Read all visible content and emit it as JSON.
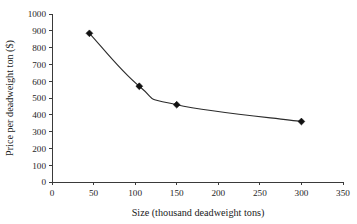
{
  "chart_data": {
    "type": "line",
    "title": "",
    "xlabel": "Size (thousand deadweight tons)",
    "ylabel": "Price per deadweight ton ($)",
    "xlim": [
      0,
      350
    ],
    "ylim": [
      0,
      1000
    ],
    "xticks": [
      0,
      50,
      100,
      150,
      200,
      250,
      300,
      350
    ],
    "yticks": [
      0,
      100,
      200,
      300,
      400,
      500,
      600,
      700,
      800,
      900,
      1000
    ],
    "xtick_labels": [
      "0",
      "50",
      "100",
      "150",
      "200",
      "250",
      "300",
      "350"
    ],
    "ytick_labels": [
      "0",
      "100",
      "200",
      "300",
      "400",
      "500",
      "600",
      "700",
      "800",
      "900",
      "1000"
    ],
    "grid": false,
    "legend": null,
    "marker": "diamond",
    "line_color": "#2b2b2b",
    "marker_color": "#111111",
    "x": [
      45,
      105,
      150,
      300
    ],
    "values": [
      885,
      570,
      460,
      360
    ],
    "series": [
      {
        "name": "Price per deadweight ton",
        "points": [
          {
            "x": 45,
            "y": 885
          },
          {
            "x": 105,
            "y": 570
          },
          {
            "x": 150,
            "y": 460
          },
          {
            "x": 300,
            "y": 360
          }
        ]
      }
    ]
  }
}
